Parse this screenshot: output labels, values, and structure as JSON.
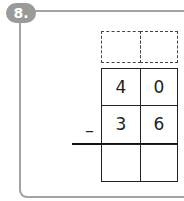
{
  "problem": {
    "number_label": "8.",
    "operator": "–",
    "grid": {
      "carry_row": [
        "",
        ""
      ],
      "minuend": [
        "4",
        "0"
      ],
      "subtrahend": [
        "3",
        "6"
      ],
      "answer": [
        "",
        ""
      ]
    }
  }
}
